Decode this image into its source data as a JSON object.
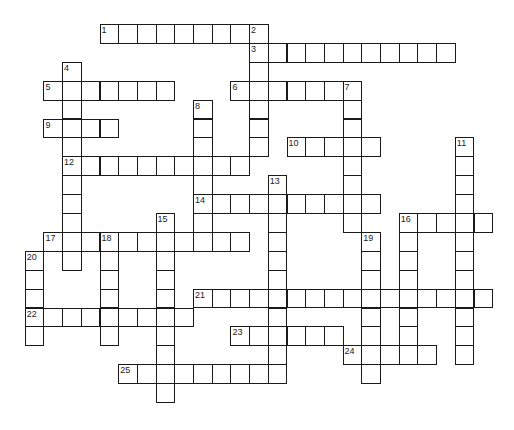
{
  "puzzle": {
    "type": "crossword",
    "grid": {
      "origin_x": 6,
      "origin_y": 24,
      "col_pitch": 18.7,
      "row_pitch": 18.9
    },
    "colors": {
      "line": "#1a1a1a",
      "cell": "#ffffff",
      "number": "#222222",
      "background": "#ffffff"
    },
    "entries": [
      {
        "number": "1",
        "direction": "across",
        "row": 0,
        "col": 5,
        "length": 9
      },
      {
        "number": "2",
        "direction": "down",
        "row": 0,
        "col": 13,
        "length": 7
      },
      {
        "number": "3",
        "direction": "across",
        "row": 1,
        "col": 13,
        "length": 11
      },
      {
        "number": "4",
        "direction": "down",
        "row": 2,
        "col": 3,
        "length": 11
      },
      {
        "number": "5",
        "direction": "across",
        "row": 3,
        "col": 2,
        "length": 7
      },
      {
        "number": "6",
        "direction": "across",
        "row": 3,
        "col": 12,
        "length": 7
      },
      {
        "number": "7",
        "direction": "down",
        "row": 3,
        "col": 18,
        "length": 8
      },
      {
        "number": "8",
        "direction": "down",
        "row": 4,
        "col": 10,
        "length": 8
      },
      {
        "number": "9",
        "direction": "across",
        "row": 5,
        "col": 2,
        "length": 4
      },
      {
        "number": "10",
        "direction": "across",
        "row": 6,
        "col": 15,
        "length": 5
      },
      {
        "number": "11",
        "direction": "down",
        "row": 6,
        "col": 24,
        "length": 12
      },
      {
        "number": "12",
        "direction": "across",
        "row": 7,
        "col": 3,
        "length": 10
      },
      {
        "number": "13",
        "direction": "down",
        "row": 8,
        "col": 14,
        "length": 11
      },
      {
        "number": "14",
        "direction": "across",
        "row": 9,
        "col": 10,
        "length": 10
      },
      {
        "number": "15",
        "direction": "down",
        "row": 10,
        "col": 8,
        "length": 10
      },
      {
        "number": "16",
        "direction": "across",
        "row": 10,
        "col": 21,
        "length": 5
      },
      {
        "number": "16",
        "direction": "down",
        "row": 10,
        "col": 21,
        "length": 8
      },
      {
        "number": "17",
        "direction": "across",
        "row": 11,
        "col": 2,
        "length": 11
      },
      {
        "number": "18",
        "direction": "down",
        "row": 11,
        "col": 5,
        "length": 6
      },
      {
        "number": "19",
        "direction": "down",
        "row": 11,
        "col": 19,
        "length": 8
      },
      {
        "number": "20",
        "direction": "down",
        "row": 12,
        "col": 1,
        "length": 5
      },
      {
        "number": "21",
        "direction": "across",
        "row": 14,
        "col": 10,
        "length": 16
      },
      {
        "number": "22",
        "direction": "across",
        "row": 15,
        "col": 1,
        "length": 9
      },
      {
        "number": "23",
        "direction": "across",
        "row": 16,
        "col": 12,
        "length": 6
      },
      {
        "number": "24",
        "direction": "across",
        "row": 17,
        "col": 18,
        "length": 5
      },
      {
        "number": "25",
        "direction": "across",
        "row": 18,
        "col": 6,
        "length": 9
      }
    ]
  }
}
